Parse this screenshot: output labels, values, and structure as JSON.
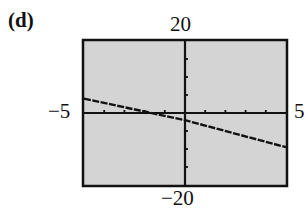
{
  "panel": {
    "label": "(d)"
  },
  "window": {
    "xmin_label": "−5",
    "xmax_label": "5",
    "ymax_label": "20",
    "ymin_label": "−20"
  },
  "colors": {
    "background": "#d4d4d4",
    "frame": "#111111",
    "line": "#111111"
  },
  "chart_data": {
    "type": "line",
    "title": "(d)",
    "xlabel": "",
    "ylabel": "",
    "xlim": [
      -5,
      5
    ],
    "ylim": [
      -20,
      20
    ],
    "x_tick_step": 1,
    "y_tick_step": 5,
    "grid": false,
    "series": [
      {
        "name": "graph",
        "x": [
          -5,
          0,
          5
        ],
        "y": [
          4,
          -2,
          -9.5
        ]
      }
    ],
    "annotations": [
      "-5",
      "5",
      "20",
      "-20"
    ]
  }
}
